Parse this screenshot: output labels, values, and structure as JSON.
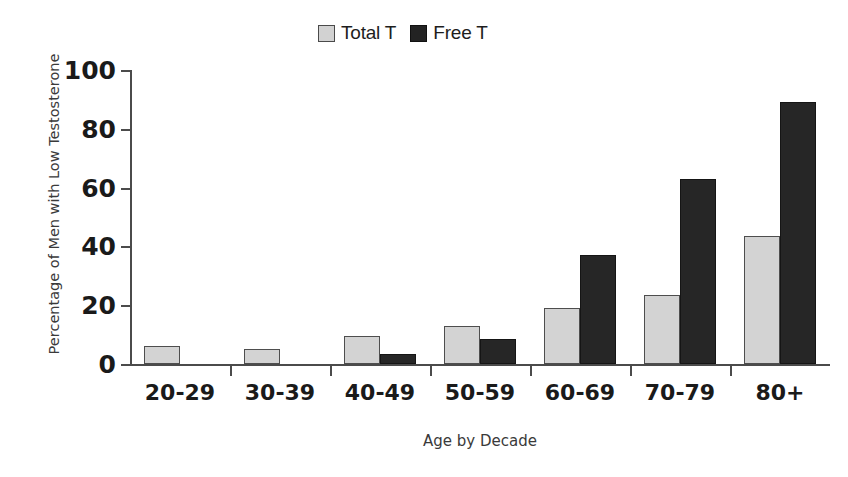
{
  "chart_data": {
    "type": "bar",
    "title": "",
    "xlabel": "Age by Decade",
    "ylabel": "Percentage of Men with Low Testosterone",
    "categories": [
      "20-29",
      "30-39",
      "40-49",
      "50-59",
      "60-69",
      "70-79",
      "80+"
    ],
    "series": [
      {
        "name": "Total T",
        "color": "#d3d3d3",
        "values": [
          6,
          5,
          9.5,
          13,
          19,
          23.5,
          43.5
        ]
      },
      {
        "name": "Free T",
        "color": "#262626",
        "values": [
          0,
          0,
          3.5,
          8.5,
          37,
          63,
          89
        ]
      }
    ],
    "ylim": [
      0,
      100
    ],
    "yticks": [
      0,
      20,
      40,
      60,
      80,
      100
    ],
    "ytick_labels": [
      "0",
      "20",
      "40",
      "60",
      "80",
      "100"
    ],
    "grid": false,
    "legend_position": "top-center"
  },
  "legend": {
    "entries": [
      {
        "label": "Total T",
        "swatch": "light-gray-square"
      },
      {
        "label": "Free T",
        "swatch": "black-square"
      }
    ]
  },
  "axes": {
    "y_title": "Percentage of Men with Low Testosterone",
    "x_title": "Age by Decade"
  }
}
